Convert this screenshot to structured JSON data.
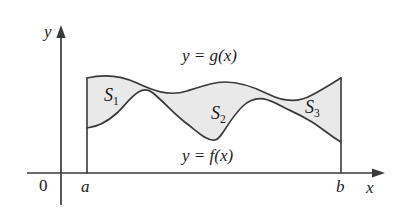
{
  "figure": {
    "kind": "area-between-curves-diagram",
    "background_color": "#ffffff",
    "curve_color": "#3a3a3a",
    "axis_color": "#3a3a3a",
    "shade_color": "#e9e9e9",
    "text_color": "#1a1a1a"
  },
  "axes": {
    "y_axis_label": "y",
    "x_axis_label": "x",
    "origin_label": "0",
    "left_bound_label": "a",
    "right_bound_label": "b"
  },
  "curves": [
    {
      "name": "upper-curve",
      "label": "y = g(x)",
      "label_y": "y",
      "label_eq": "=",
      "label_fn": "g(x)"
    },
    {
      "name": "lower-curve",
      "label": "y = f(x)",
      "label_y": "y",
      "label_eq": "=",
      "label_fn": "f(x)"
    }
  ],
  "regions": [
    {
      "name": "region-s1",
      "base": "S",
      "sub": "1",
      "label": "S1"
    },
    {
      "name": "region-s2",
      "base": "S",
      "sub": "2",
      "label": "S2"
    },
    {
      "name": "region-s3",
      "base": "S",
      "sub": "3",
      "label": "S3"
    }
  ],
  "geometry": {
    "x_axis_y": 173,
    "y_axis_x": 61,
    "a_x": 87,
    "b_x": 341,
    "crossing_left": [
      153,
      93
    ],
    "crossing_right": [
      285,
      108
    ]
  }
}
